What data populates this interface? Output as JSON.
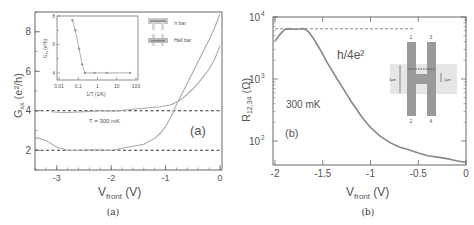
{
  "chart_data": [
    {
      "id": "a",
      "type": "line",
      "caption": "(a)",
      "panel_label": "(a)",
      "xlabel": "V",
      "xlabel_sub": "front",
      "xlabel_unit": " (V)",
      "ylabel": "G",
      "ylabel_sub": "xx",
      "ylabel_unit": " (e²/h)",
      "xlim": [
        -3.4,
        0
      ],
      "ylim": [
        1,
        9
      ],
      "xticks": [
        -3,
        -2,
        -1,
        0
      ],
      "xtick_labels": [
        "-3",
        "-2",
        "-1",
        "0"
      ],
      "yticks": [
        2,
        4,
        6,
        8
      ],
      "ytick_labels": [
        "2",
        "4",
        "6",
        "8"
      ],
      "annotation": "T = 300 mK",
      "reference_lines": [
        {
          "y": 4,
          "style": "dashed"
        },
        {
          "y": 2,
          "style": "dashed"
        }
      ],
      "series": [
        {
          "name": "π bar",
          "x": [
            -3.1,
            -2.9,
            -2.7,
            -2.5,
            -2.3,
            -2.1,
            -1.9,
            -1.7,
            -1.5,
            -1.3,
            -1.1,
            -0.9,
            -0.8,
            -0.7,
            -0.6,
            -0.5,
            -0.4,
            -0.3,
            -0.2,
            -0.1,
            0
          ],
          "y": [
            3.95,
            3.9,
            3.92,
            3.95,
            3.98,
            4.0,
            3.98,
            4.05,
            4.1,
            4.15,
            4.2,
            4.3,
            4.45,
            4.6,
            4.85,
            5.1,
            5.4,
            5.75,
            6.1,
            6.6,
            7.3
          ]
        },
        {
          "name": "Hall bar",
          "x": [
            -3.4,
            -3.2,
            -3.0,
            -2.8,
            -2.6,
            -2.4,
            -2.2,
            -2.0,
            -1.8,
            -1.6,
            -1.4,
            -1.2,
            -1.1,
            -1.0,
            -0.9,
            -0.8,
            -0.7,
            -0.6,
            -0.5,
            -0.4,
            -0.3,
            -0.2,
            -0.1,
            0
          ],
          "y": [
            2.65,
            2.5,
            2.15,
            2.0,
            2.0,
            2.03,
            2.02,
            2.0,
            2.1,
            2.2,
            2.3,
            2.6,
            2.85,
            3.2,
            3.7,
            4.3,
            4.85,
            5.4,
            5.95,
            6.5,
            7.05,
            7.6,
            8.2,
            8.9
          ]
        }
      ],
      "legend": {
        "placement": "top-right",
        "entries": [
          "π bar",
          "Hall bar"
        ]
      },
      "inset": {
        "type": "line",
        "xlabel": "1/T (1/K)",
        "ylabel": "G",
        "ylabel_sub": "xx",
        "ylabel_unit": " (e²/h)",
        "xscale": "log",
        "xlim": [
          0.01,
          100
        ],
        "ylim": [
          3.5,
          8
        ],
        "xticks": [
          0.01,
          0.1,
          1,
          10,
          100
        ],
        "xtick_labels": [
          "0.01",
          "0.1",
          "1",
          "10",
          "100"
        ],
        "yticks": [
          4,
          6,
          8
        ],
        "ytick_labels": [
          "4",
          "6",
          "8"
        ],
        "x": [
          0.05,
          0.07,
          0.11,
          0.16,
          0.22,
          0.7,
          3,
          50
        ],
        "y": [
          7.7,
          7.0,
          5.7,
          4.6,
          4.0,
          4.0,
          4.0,
          4.0
        ]
      }
    },
    {
      "id": "b",
      "type": "line",
      "caption": "(b)",
      "panel_label": "(b)",
      "xlabel": "V",
      "xlabel_sub": "front",
      "xlabel_unit": " (V)",
      "ylabel": "R",
      "ylabel_sub": "12,34",
      "ylabel_unit": " (Ω)",
      "xlim": [
        -2,
        0
      ],
      "yscale": "log",
      "ylim": [
        41,
        10000
      ],
      "xticks": [
        -2,
        -1.5,
        -1,
        -0.5,
        0
      ],
      "xtick_labels": [
        "-2",
        "-1.5",
        "-1",
        "-0.5",
        "0"
      ],
      "yticks": [
        100,
        1000,
        10000
      ],
      "ytick_labels": [
        "10",
        "10",
        "10"
      ],
      "ytick_exponents": [
        "2",
        "3",
        "4"
      ],
      "annotation": "300 mK",
      "reference_label": "h/4e²",
      "reference_lines": [
        {
          "y": 6450,
          "style": "dashed",
          "xrange": [
            -2,
            -0.55
          ]
        }
      ],
      "series": [
        {
          "name": "R12,34",
          "x": [
            -2.0,
            -1.95,
            -1.9,
            -1.85,
            -1.8,
            -1.75,
            -1.7,
            -1.65,
            -1.6,
            -1.55,
            -1.5,
            -1.45,
            -1.4,
            -1.35,
            -1.3,
            -1.25,
            -1.2,
            -1.15,
            -1.1,
            -1.05,
            -1.0,
            -0.9,
            -0.8,
            -0.7,
            -0.6,
            -0.5,
            -0.4,
            -0.3,
            -0.2,
            -0.1,
            0
          ],
          "y": [
            4100,
            5200,
            6300,
            6500,
            6350,
            6400,
            6500,
            5800,
            4600,
            3400,
            2500,
            1800,
            1350,
            1000,
            760,
            570,
            430,
            330,
            255,
            205,
            165,
            120,
            95,
            80,
            72,
            64,
            58,
            55,
            52,
            48,
            45
          ]
        }
      ],
      "device_inset": {
        "terminals": [
          "1",
          "3",
          "2",
          "4"
        ],
        "dimension_labels": [
          "3μm",
          "1μm"
        ]
      }
    }
  ]
}
